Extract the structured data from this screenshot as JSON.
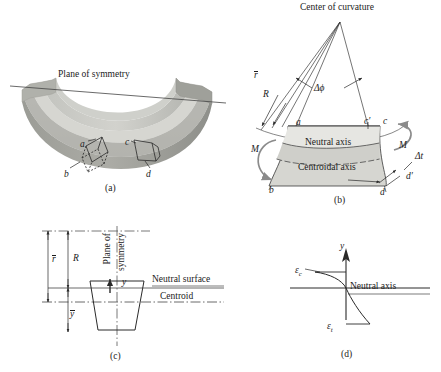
{
  "figure": {
    "background_color": "#ffffff",
    "line_color": "#1b1b1b",
    "fill_light": "#d9d9d6",
    "fill_mid": "#b9bab5",
    "fill_dark": "#9a9b96",
    "fill_darker": "#878883"
  },
  "panel_a": {
    "caption": "(a)",
    "plane_of_symmetry": "Plane of symmetry",
    "corner_a": "a",
    "corner_b": "b",
    "corner_c": "c",
    "corner_d": "d"
  },
  "panel_b": {
    "caption": "(b)",
    "title": "Center of curvature",
    "r_bar": "r",
    "R": "R",
    "delta_phi": "Δϕ",
    "point_a": "a",
    "point_b": "b",
    "point_c": "c",
    "point_c_prime": "c′",
    "point_d": "d",
    "point_d_prime": "d′",
    "neutral_axis": "Neutral axis",
    "centroidal_axis": "Centroidal axis",
    "moment_left": "M",
    "moment_right": "M",
    "delta_t": "Δt"
  },
  "panel_c": {
    "caption": "(c)",
    "r_bar": "r",
    "R": "R",
    "y_bar": "y",
    "plane_line1": "Plane of",
    "plane_line2": "symmetry",
    "y": "y",
    "neutral_surface": "Neutral surface",
    "centroid": "Centroid"
  },
  "panel_d": {
    "caption": "(d)",
    "y_axis": "y",
    "strain_compression": "ε",
    "strain_compression_sub": "c",
    "strain_tension": "ε",
    "strain_tension_sub": "t",
    "neutral_axis": "Neutral axis"
  }
}
